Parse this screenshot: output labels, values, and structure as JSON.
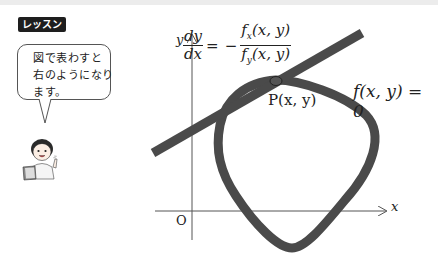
{
  "header": {
    "lesson_badge": "レッスン"
  },
  "speech_bubble": {
    "lines": [
      "図で表わすと",
      "右のようになり",
      "ます。"
    ]
  },
  "diagram": {
    "axis_x_label": "x",
    "axis_y_label": "y",
    "origin_label": "O",
    "formula": {
      "lhs_num": "dy",
      "lhs_den": "dx",
      "equals": "=",
      "minus": "−",
      "rhs_num_f": "f",
      "rhs_num_sub": "x",
      "rhs_num_args": "(x, y)",
      "rhs_den_f": "f",
      "rhs_den_sub": "y",
      "rhs_den_args": "(x, y)"
    },
    "curve_label": "f(x, y) = 0",
    "point_label": "P(x, y)",
    "colors": {
      "curve": "#4a4a4a",
      "tangent": "#4a4a4a",
      "axes": "#555555"
    }
  }
}
